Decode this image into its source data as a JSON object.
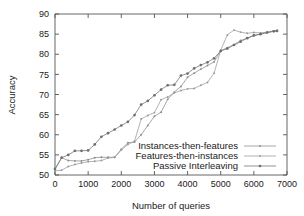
{
  "chart_data": {
    "type": "line",
    "title": "",
    "xlabel": "Number of queries",
    "ylabel": "Accuracy",
    "xlim": [
      0,
      7000
    ],
    "ylim": [
      50,
      90
    ],
    "xticks": [
      0,
      1000,
      2000,
      3000,
      4000,
      5000,
      6000,
      7000
    ],
    "yticks": [
      50,
      55,
      60,
      65,
      70,
      75,
      80,
      85,
      90
    ],
    "grid": false,
    "legend_position": "bottom-right",
    "series": [
      {
        "name": "Instances-then-features",
        "color": "#8a8a8a",
        "marker": "dot-small",
        "x": [
          0,
          200,
          400,
          600,
          800,
          1000,
          1200,
          1400,
          1600,
          1800,
          2000,
          2200,
          2400,
          2600,
          2800,
          3000,
          3200,
          3400,
          3600,
          3800,
          4000,
          4200,
          4400,
          4600,
          4800,
          5000,
          5200,
          5400,
          5600,
          5800,
          6000,
          6200,
          6400,
          6600,
          6700
        ],
        "y": [
          51.4,
          54.3,
          53.6,
          53.5,
          53.5,
          53.8,
          54.3,
          54.4,
          54.4,
          54.4,
          56.4,
          58.0,
          58.2,
          60.0,
          62.3,
          64.6,
          65.6,
          68.8,
          70.6,
          72.0,
          74.3,
          75.3,
          76.3,
          77.2,
          78.1,
          80.9,
          81.6,
          82.4,
          83.4,
          84.0,
          84.6,
          85.0,
          85.4,
          85.7,
          85.8
        ]
      },
      {
        "name": "Features-then-instances",
        "color": "#9a9a9a",
        "marker": "dot-small",
        "x": [
          0,
          200,
          400,
          600,
          800,
          1000,
          1200,
          1400,
          1600,
          1800,
          2000,
          2200,
          2400,
          2600,
          2800,
          3000,
          3200,
          3400,
          3600,
          3800,
          4000,
          4200,
          4400,
          4600,
          4800,
          5000,
          5200,
          5400,
          5600,
          5800,
          6000,
          6200,
          6400,
          6600,
          6700
        ],
        "y": [
          51.0,
          51.2,
          52.1,
          52.6,
          53.0,
          53.3,
          53.4,
          53.6,
          54.2,
          54.4,
          56.2,
          57.6,
          58.4,
          63.9,
          64.8,
          65.5,
          68.7,
          69.4,
          70.4,
          71.0,
          71.4,
          71.5,
          72.3,
          73.0,
          75.3,
          81.0,
          84.8,
          86.0,
          85.5,
          85.2,
          85.4,
          85.3,
          85.5,
          85.8,
          85.9
        ]
      },
      {
        "name": "Passive Interleaving",
        "color": "#6e6e6e",
        "marker": "dot-medium",
        "x": [
          0,
          200,
          400,
          600,
          800,
          1000,
          1200,
          1400,
          1600,
          1800,
          2000,
          2200,
          2400,
          2600,
          2800,
          3000,
          3200,
          3400,
          3600,
          3800,
          4000,
          4200,
          4400,
          4600,
          4800,
          5000,
          5200,
          5400,
          5600,
          5800,
          6000,
          6200,
          6400,
          6600,
          6700
        ],
        "y": [
          51.5,
          54.3,
          55.0,
          56.0,
          56.0,
          56.1,
          57.6,
          59.5,
          60.4,
          61.3,
          62.3,
          63.2,
          64.9,
          67.5,
          68.4,
          69.8,
          71.2,
          72.3,
          72.4,
          74.7,
          75.2,
          76.5,
          77.3,
          78.0,
          79.0,
          80.8,
          81.4,
          82.3,
          83.1,
          84.0,
          84.7,
          85.0,
          85.4,
          85.7,
          85.8
        ]
      }
    ]
  },
  "axes": {
    "xlabel": "Number of queries",
    "ylabel": "Accuracy",
    "xtick_labels": [
      "0",
      "1000",
      "2000",
      "3000",
      "4000",
      "5000",
      "6000",
      "7000"
    ],
    "ytick_labels": [
      "50",
      "55",
      "60",
      "65",
      "70",
      "75",
      "80",
      "85",
      "90"
    ]
  },
  "legend": {
    "items": [
      {
        "label": "Instances-then-features"
      },
      {
        "label": "Features-then-instances"
      },
      {
        "label": "Passive Interleaving"
      }
    ]
  }
}
